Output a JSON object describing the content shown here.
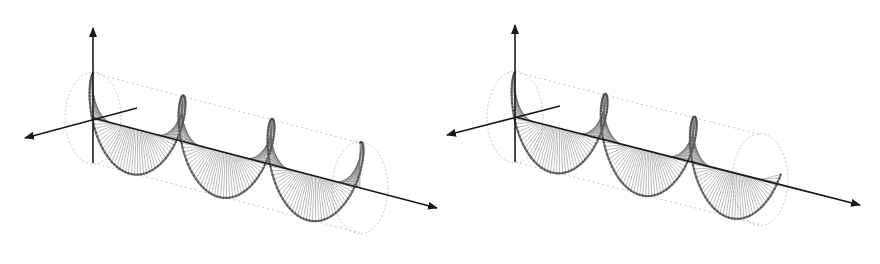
{
  "diagram": {
    "title": "",
    "colors": {
      "background": "#ffffff",
      "axis": "#1a1a1a",
      "vector": "#6a6a6a",
      "rim": "#555555",
      "cylinder": "#c8c8c8"
    },
    "panels": [
      {
        "id": "left",
        "handedness": "left",
        "origin": [
          93,
          118
        ],
        "axis_up_end": [
          93,
          28
        ],
        "axis_left_end": [
          25,
          138
        ],
        "axis_back_end": [
          137,
          108
        ],
        "propagation_end": [
          437,
          208
        ],
        "radius": 45,
        "turns": 3.0,
        "turn_length": 92,
        "phase_start": 90
      },
      {
        "id": "right",
        "handedness": "right",
        "origin": [
          75,
          117
        ],
        "axis_up_end": [
          75,
          25
        ],
        "axis_left_end": [
          7,
          135
        ],
        "axis_back_end": [
          120,
          106
        ],
        "propagation_end": [
          420,
          205
        ],
        "radius": 45,
        "turns": 2.75,
        "turn_length": 92,
        "phase_start": 90
      }
    ]
  }
}
